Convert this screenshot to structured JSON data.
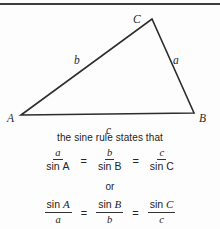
{
  "figure": {
    "vertices": [
      {
        "id": "A",
        "label": "A",
        "x": 21,
        "y": 115
      },
      {
        "id": "B",
        "label": "B",
        "x": 194,
        "y": 113
      },
      {
        "id": "C",
        "label": "C",
        "x": 152,
        "y": 19
      }
    ],
    "sides": [
      {
        "id": "a",
        "label": "a",
        "between": "B-C"
      },
      {
        "id": "b",
        "label": "b",
        "between": "A-C"
      },
      {
        "id": "c",
        "label": "c",
        "between": "A-B"
      }
    ],
    "stroke_color": "#2d2d2d"
  },
  "text": {
    "states_line": "the sine rule states that",
    "or": "or",
    "equals": "="
  },
  "equation_1": {
    "terms": [
      {
        "numerator": "a",
        "denominator_fn": "sin",
        "denominator_arg": "A"
      },
      {
        "numerator": "b",
        "denominator_fn": "sin",
        "denominator_arg": "B"
      },
      {
        "numerator": "c",
        "denominator_fn": "sin",
        "denominator_arg": "C"
      }
    ]
  },
  "equation_2": {
    "terms": [
      {
        "numerator_fn": "sin",
        "numerator_arg": "A",
        "denominator": "a"
      },
      {
        "numerator_fn": "sin",
        "numerator_arg": "B",
        "denominator": "b"
      },
      {
        "numerator_fn": "sin",
        "numerator_arg": "C",
        "denominator": "c"
      }
    ]
  },
  "colors": {
    "rule": "#3c3c3c",
    "ink": "#232323",
    "background": "#fdfdfd"
  }
}
